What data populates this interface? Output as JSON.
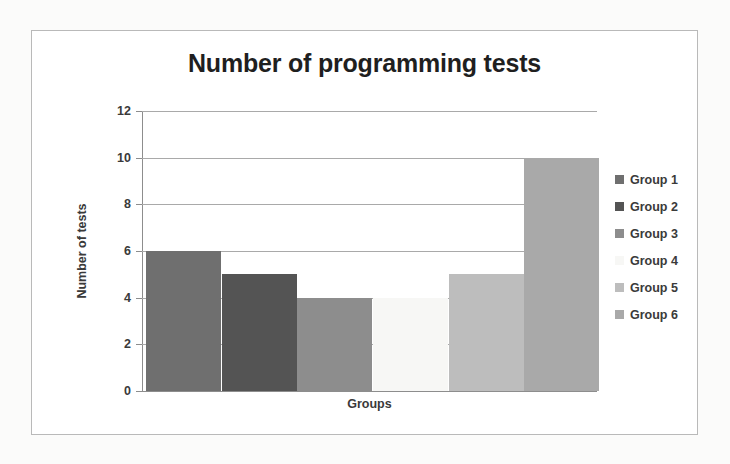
{
  "chart_data": {
    "type": "bar",
    "title": "Number of programming tests",
    "xlabel": "Groups",
    "ylabel": "Number of tests",
    "categories": [
      "Group 1",
      "Group 2",
      "Group 3",
      "Group 4",
      "Group 5",
      "Group 6"
    ],
    "values": [
      6,
      5,
      4,
      4,
      5,
      10
    ],
    "colors": [
      "#6f6f6f",
      "#545454",
      "#8d8d8d",
      "#f7f7f5",
      "#bdbdbd",
      "#a9a9a9"
    ],
    "ylim": [
      0,
      12
    ],
    "yticks": [
      0,
      2,
      4,
      6,
      8,
      10,
      12
    ],
    "ytick_labels": [
      "0",
      "2",
      "4",
      "6",
      "8",
      "10",
      "12"
    ],
    "grid": true,
    "legend": {
      "position": "right",
      "entries": [
        {
          "label": "Group 1",
          "color": "#6f6f6f"
        },
        {
          "label": "Group 2",
          "color": "#545454"
        },
        {
          "label": "Group 3",
          "color": "#8d8d8d"
        },
        {
          "label": "Group 4",
          "color": "#f7f7f5"
        },
        {
          "label": "Group 5",
          "color": "#bdbdbd"
        },
        {
          "label": "Group 6",
          "color": "#a9a9a9"
        }
      ]
    }
  }
}
